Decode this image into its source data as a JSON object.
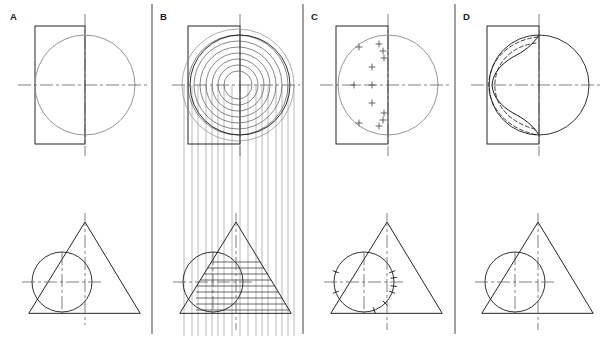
{
  "figure": {
    "type": "engineering-drawing",
    "width": 608,
    "height": 338,
    "background_color": "#ffffff",
    "line_color_dark": "#1a1a1a",
    "line_color_light": "#8a8a8a",
    "line_color_medium": "#555555",
    "panel_count": 4
  },
  "dividers": [
    {
      "name": "divider-a-b",
      "x": 152
    },
    {
      "name": "divider-b-c",
      "x": 303
    },
    {
      "name": "divider-c-d",
      "x": 455
    }
  ],
  "panels": [
    {
      "id": "A",
      "label": "A",
      "label_x": 10,
      "label_y": 20,
      "caption": "Step A - given views: sphere (circle) and cone, front view and top view",
      "front_view": {
        "name": "front-view-a",
        "circle": {
          "cx": 85,
          "cy": 85,
          "r": 50,
          "tone": "light"
        },
        "rect": {
          "x": 35,
          "y": 26,
          "w": 50,
          "h": 118,
          "tone": "dark"
        },
        "center_h": {
          "x1": 18,
          "y1": 85,
          "x2": 150,
          "y2": 85
        },
        "center_v": {
          "x1": 85,
          "y1": 14,
          "x2": 85,
          "y2": 156
        }
      },
      "top_view": {
        "name": "top-view-a",
        "circle": {
          "cx": 62,
          "cy": 282,
          "r": 30,
          "tone": "dark"
        },
        "triangle": {
          "apex_x": 85,
          "apex_y": 222,
          "left_x": 29,
          "right_x": 140,
          "base_y": 313
        },
        "center_h": {
          "x1": 22,
          "y1": 282,
          "x2": 104,
          "y2": 282
        },
        "center_v": {
          "x1": 62,
          "y1": 252,
          "x2": 62,
          "y2": 313
        },
        "axis_v": {
          "x1": 85,
          "y1": 213,
          "x2": 85,
          "y2": 325
        }
      }
    },
    {
      "id": "B",
      "label": "B",
      "label_x": 160,
      "label_y": 20,
      "caption": "Step B - concentric cutting circles drawn in the front view and projected down to the top view",
      "front_view": {
        "name": "front-view-b",
        "circle": {
          "cx": 240,
          "cy": 85,
          "r": 50,
          "tone": "dark"
        },
        "rect": {
          "x": 188,
          "y": 26,
          "w": 52,
          "h": 118,
          "tone": "dark"
        },
        "center_h": {
          "x1": 172,
          "y1": 85,
          "x2": 300,
          "y2": 85
        },
        "center_v": {
          "x1": 240,
          "y1": 14,
          "x2": 240,
          "y2": 156
        },
        "cutting_circle_center": {
          "cx": 238,
          "cy": 85
        },
        "cutting_circle_radii": [
          14,
          20,
          26,
          32,
          38,
          44,
          50,
          56
        ],
        "cutting_circle_count": 8
      },
      "projection_lines": {
        "name": "projection-lines-b",
        "orientation": "vertical",
        "y_top": 85,
        "y_bottom": 336,
        "x_positions": [
          184,
          192,
          198,
          206,
          212,
          218,
          224,
          232,
          240,
          248,
          256,
          262,
          268,
          276,
          282,
          288,
          294
        ]
      },
      "top_view": {
        "name": "top-view-b",
        "circle": {
          "cx": 213,
          "cy": 282,
          "r": 30,
          "tone": "dark"
        },
        "triangle": {
          "apex_x": 236,
          "apex_y": 222,
          "left_x": 180,
          "right_x": 291,
          "base_y": 313
        },
        "center_h": {
          "x1": 173,
          "y1": 282,
          "x2": 255,
          "y2": 282
        },
        "center_v": {
          "x1": 213,
          "y1": 252,
          "x2": 213,
          "y2": 313
        },
        "axis_v": {
          "x1": 236,
          "y1": 213,
          "x2": 236,
          "y2": 330
        },
        "horizontal_cut_lines_y": [
          262,
          268,
          274,
          280,
          286,
          292,
          298,
          304,
          310
        ]
      }
    },
    {
      "id": "C",
      "label": "C",
      "label_x": 311,
      "label_y": 20,
      "caption": "Step C - intersection points plotted (crosses) in the front view; tick marks located on the top view circle",
      "front_view": {
        "name": "front-view-c",
        "circle": {
          "cx": 388,
          "cy": 85,
          "r": 50,
          "tone": "light"
        },
        "rect": {
          "x": 336,
          "y": 26,
          "w": 52,
          "h": 118,
          "tone": "dark"
        },
        "center_h": {
          "x1": 320,
          "y1": 85,
          "x2": 452,
          "y2": 85
        },
        "center_v": {
          "x1": 388,
          "y1": 14,
          "x2": 388,
          "y2": 156
        },
        "plot_points": [
          {
            "x": 359,
            "y": 47
          },
          {
            "x": 379,
            "y": 44
          },
          {
            "x": 383,
            "y": 51
          },
          {
            "x": 384,
            "y": 58
          },
          {
            "x": 372,
            "y": 67
          },
          {
            "x": 354,
            "y": 85
          },
          {
            "x": 372,
            "y": 85
          },
          {
            "x": 372,
            "y": 103
          },
          {
            "x": 384,
            "y": 113
          },
          {
            "x": 383,
            "y": 120
          },
          {
            "x": 379,
            "y": 126
          },
          {
            "x": 359,
            "y": 123
          }
        ],
        "plot_point_count": 12,
        "marker": "cross"
      },
      "top_view": {
        "name": "top-view-c",
        "circle": {
          "cx": 364,
          "cy": 282,
          "r": 30,
          "tone": "dark"
        },
        "triangle": {
          "apex_x": 387,
          "apex_y": 222,
          "left_x": 331,
          "right_x": 442,
          "base_y": 313
        },
        "center_h": {
          "x1": 324,
          "y1": 282,
          "x2": 406,
          "y2": 282
        },
        "center_v": {
          "x1": 364,
          "y1": 252,
          "x2": 364,
          "y2": 313
        },
        "axis_v": {
          "x1": 387,
          "y1": 213,
          "x2": 387,
          "y2": 330
        },
        "tick_angles_deg": [
          20,
          8,
          -8,
          -20,
          -45,
          -70,
          160,
          200
        ]
      }
    },
    {
      "id": "D",
      "label": "D",
      "label_x": 463,
      "label_y": 20,
      "caption": "Step D - finished views: visible intersection curve solid, hidden intersection dashed",
      "front_view": {
        "name": "front-view-d",
        "circle": {
          "cx": 539,
          "cy": 85,
          "r": 50,
          "tone": "dark"
        },
        "rect": {
          "x": 487,
          "y": 26,
          "w": 52,
          "h": 118,
          "tone": "dark"
        },
        "center_h": {
          "x1": 471,
          "y1": 85,
          "x2": 603,
          "y2": 85
        },
        "center_v": {
          "x1": 539,
          "y1": 14,
          "x2": 539,
          "y2": 156
        },
        "intersection_curve_style": "solid",
        "hidden_curve_style": "dashed",
        "hidden_curve_count": 2
      },
      "top_view": {
        "name": "top-view-d",
        "circle": {
          "cx": 515,
          "cy": 282,
          "r": 30,
          "tone": "dark"
        },
        "triangle": {
          "apex_x": 538,
          "apex_y": 222,
          "left_x": 482,
          "right_x": 593,
          "base_y": 313
        },
        "center_h": {
          "x1": 475,
          "y1": 282,
          "x2": 557,
          "y2": 282
        },
        "center_v": {
          "x1": 515,
          "y1": 252,
          "x2": 515,
          "y2": 313
        },
        "axis_v": {
          "x1": 538,
          "y1": 213,
          "x2": 538,
          "y2": 330
        }
      }
    }
  ]
}
